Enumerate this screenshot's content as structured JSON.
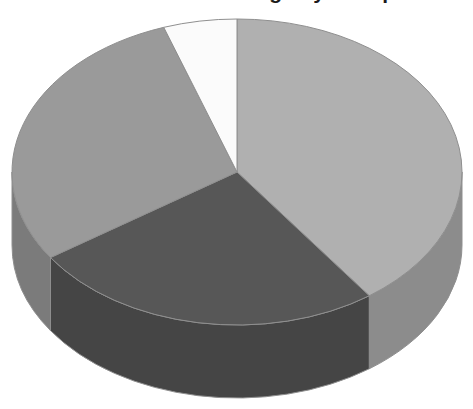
{
  "title": {
    "text": "Distribution of Usage by Group",
    "visible_fragment": "partially cropped at top edge",
    "color": "#1a1a1a"
  },
  "chart_data": {
    "type": "pie",
    "title": "Distribution of Usage by Group",
    "subtitle": "",
    "xlabel": "",
    "ylabel": "",
    "legend_position": "none",
    "grid": false,
    "style": "3d-pie",
    "start_angle_deg": 0,
    "direction": "clockwise",
    "categories": [
      "Segment 1",
      "Segment 2",
      "Segment 3",
      "Segment 4"
    ],
    "values": [
      40,
      25.5,
      29,
      5.5
    ],
    "labels": [],
    "colors": [
      "#b0b0b0",
      "#575757",
      "#9a9a9a",
      "#fbfbfb"
    ],
    "slices": [
      {
        "name": "Segment 1",
        "value": 40,
        "percent": 40,
        "color": "#b0b0b0",
        "side_color": "#8c8c8c",
        "start_deg": 0,
        "end_deg": 144
      },
      {
        "name": "Segment 2",
        "value": 25.5,
        "percent": 25.5,
        "color": "#575757",
        "side_color": "#454545",
        "start_deg": 144,
        "end_deg": 236
      },
      {
        "name": "Segment 3",
        "value": 29,
        "percent": 29,
        "color": "#9a9a9a",
        "side_color": "#7b7b7b",
        "start_deg": 236,
        "end_deg": 341
      },
      {
        "name": "Segment 4",
        "value": 5.5,
        "percent": 5.5,
        "color": "#fbfbfb",
        "side_color": "#d8d8d8",
        "start_deg": 341,
        "end_deg": 360
      }
    ],
    "geometry": {
      "center_x": 237,
      "center_y": 172,
      "radius_x": 225,
      "radius_y": 153,
      "depth": 73
    },
    "outline_color": "#8f8f8f",
    "background": "#ffffff"
  }
}
